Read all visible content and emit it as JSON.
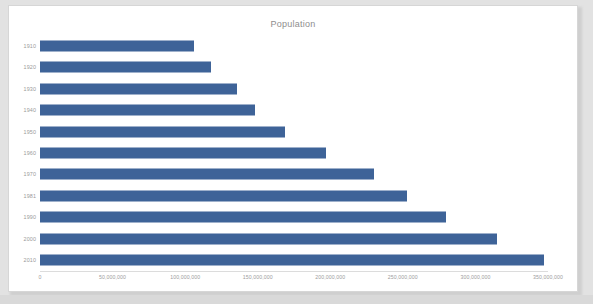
{
  "chart": {
    "title": "Population"
  },
  "chart_data": {
    "type": "bar",
    "orientation": "horizontal",
    "title": "Population",
    "xlabel": "",
    "ylabel": "",
    "categories": [
      "1910",
      "1920",
      "1930",
      "1940",
      "1950",
      "1960",
      "1970",
      "1981",
      "1990",
      "2000",
      "2010"
    ],
    "values": [
      106000000,
      118000000,
      136000000,
      148000000,
      169000000,
      197000000,
      230000000,
      253000000,
      280000000,
      315000000,
      347000000
    ],
    "series": [
      {
        "name": "Population",
        "values": [
          106000000,
          118000000,
          136000000,
          148000000,
          169000000,
          197000000,
          230000000,
          253000000,
          280000000,
          315000000,
          347000000
        ]
      }
    ],
    "xlim": [
      0,
      350000000
    ],
    "xticks": [
      0,
      50000000,
      100000000,
      150000000,
      200000000,
      250000000,
      300000000,
      350000000
    ],
    "xtick_labels": [
      "0",
      "50,000,000",
      "100,000,000",
      "150,000,000",
      "200,000,000",
      "250,000,000",
      "300,000,000",
      "350,000,000"
    ],
    "grid": false,
    "legend": "none",
    "bar_color": "#3e6398",
    "title_color": "#8e8e8e",
    "tick_color": "#9a9a9a",
    "plot_background": "#ffffff"
  }
}
